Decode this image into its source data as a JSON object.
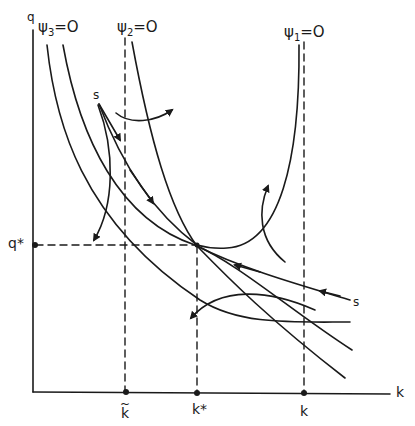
{
  "diagram": {
    "type": "phase-diagram",
    "axes": {
      "y_label": "q",
      "x_label": "k",
      "origin_px": [
        33,
        392
      ]
    },
    "isoclines": [
      {
        "id": "psi3",
        "label_symbol": "ψ",
        "label_sub": "3",
        "label_eq": "=O"
      },
      {
        "id": "psi2",
        "label_symbol": "ψ",
        "label_sub": "2",
        "label_eq": "=O"
      },
      {
        "id": "psi1",
        "label_symbol": "ψ",
        "label_sub": "1",
        "label_eq": "=O"
      }
    ],
    "x_ticks": [
      {
        "id": "k-tilde",
        "label": "k",
        "accent": "~"
      },
      {
        "id": "k-star",
        "label": "k*"
      },
      {
        "id": "k-bar",
        "label": "k"
      }
    ],
    "y_ticks": [
      {
        "id": "q-star",
        "label": "q*"
      }
    ],
    "saddle_path_label": "s",
    "steady_state": {
      "k": "k*",
      "q": "q*"
    },
    "colors": {
      "ink": "#1a1a1a",
      "background": "#ffffff"
    }
  }
}
